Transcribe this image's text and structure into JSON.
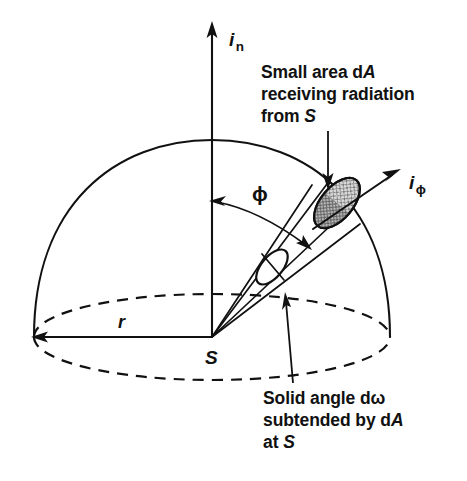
{
  "figure": {
    "background_color": "#ffffff",
    "ink_color": "#111111",
    "patch_fill_color": "#c9c9c9"
  },
  "axes": {
    "normal_axis": {
      "symbol": "i",
      "subscript": "n",
      "name": "normal-intensity-axis"
    },
    "phi_axis": {
      "symbol": "i",
      "subscript": "ϕ",
      "name": "phi-intensity-axis"
    }
  },
  "labels": {
    "radius": "r",
    "source": "S",
    "angle": "ϕ"
  },
  "annotations": {
    "area": {
      "line1_prefix": "Small area d",
      "line1_italic": "A",
      "line2": "receiving radiation",
      "line3_prefix": "from ",
      "line3_italic": "S"
    },
    "solid_angle": {
      "line1": "Solid angle dω",
      "line2_prefix": "subtended by d",
      "line2_italic": "A",
      "line3_prefix": "at ",
      "line3_italic": "S"
    }
  },
  "geometry": {
    "source_point": {
      "x": 212,
      "y": 337
    },
    "hemisphere_radius_x": 178,
    "hemisphere_radius_y": 44,
    "dome_apex": {
      "x": 212,
      "y": 140
    },
    "radius_tip": {
      "x": 34,
      "y": 337
    },
    "patch_center": {
      "x": 337,
      "y": 203
    },
    "phi_angle_degrees": 52
  }
}
